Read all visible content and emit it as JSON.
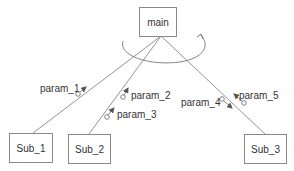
{
  "diagram": {
    "type": "structure-chart",
    "colors": {
      "line": "#707070",
      "box_border": "#8a8a8a",
      "text": "#333333",
      "background": "#ffffff"
    },
    "main": {
      "label": "main"
    },
    "modules": [
      {
        "id": "sub1",
        "label": "Sub_1"
      },
      {
        "id": "sub2",
        "label": "Sub_2"
      },
      {
        "id": "sub3",
        "label": "Sub_3"
      }
    ],
    "loop_icon": "iteration-arc-arrow",
    "params": [
      {
        "label": "param_1",
        "connection": "main-sub1",
        "direction": "up"
      },
      {
        "label": "param_2",
        "connection": "main-sub2",
        "direction": "up"
      },
      {
        "label": "param_3",
        "connection": "main-sub2",
        "direction": "up"
      },
      {
        "label": "param_4",
        "connection": "main-sub3",
        "direction": "down"
      },
      {
        "label": "param_5",
        "connection": "main-sub3",
        "direction": "up"
      }
    ]
  }
}
